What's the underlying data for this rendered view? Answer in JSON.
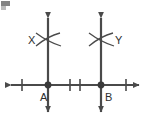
{
  "figure": {
    "background_color": "#ffffff",
    "stroke_color": "#4a4a4a",
    "label_color": "#2e2e2e",
    "width": 150,
    "height": 129
  },
  "labels": {
    "point_a": "A",
    "point_b": "B",
    "arc_intersection_left": "X",
    "arc_intersection_right": "Y"
  },
  "geometry": {
    "horizontal_line": {
      "name": "base-line",
      "y": 85,
      "x_start": 4,
      "x_end": 146,
      "arrow_left": true,
      "arrow_right": true
    },
    "vertical_lines": [
      {
        "name": "perpendicular-line-left",
        "x": 48,
        "y_top": 11,
        "y_bottom": 119,
        "arrow_top": true,
        "arrow_bottom": true
      },
      {
        "name": "perpendicular-line-right",
        "x": 101,
        "y_top": 11,
        "y_bottom": 119,
        "arrow_top": true,
        "arrow_bottom": true
      }
    ],
    "points": [
      {
        "name": "point-a",
        "label": "A",
        "x": 48,
        "y": 85,
        "label_x": 44,
        "label_y": 98
      },
      {
        "name": "point-b",
        "label": "B",
        "x": 101,
        "y": 85,
        "label_x": 105,
        "label_y": 98
      }
    ],
    "tick_marks": [
      {
        "name": "tick-mark-1",
        "x": 22,
        "y": 85,
        "half_height": 6
      },
      {
        "name": "tick-mark-2",
        "x": 70,
        "y": 85,
        "half_height": 6
      },
      {
        "name": "tick-mark-3",
        "x": 80,
        "y": 85,
        "half_height": 6
      },
      {
        "name": "tick-mark-4",
        "x": 126,
        "y": 85,
        "half_height": 6
      }
    ],
    "arc_crossings": [
      {
        "name": "arc-crossing-left",
        "cx": 48,
        "cy": 40,
        "label": "X",
        "label_x": 33,
        "label_y": 44,
        "label_side": "left"
      },
      {
        "name": "arc-crossing-right",
        "cx": 101,
        "cy": 40,
        "label": "Y",
        "label_x": 113,
        "label_y": 44,
        "label_side": "right"
      }
    ]
  },
  "artifact": {
    "name": "corner-scan-artifact",
    "x": 1,
    "y": 1,
    "width": 9,
    "height": 5,
    "color": "#6d6d6d"
  }
}
